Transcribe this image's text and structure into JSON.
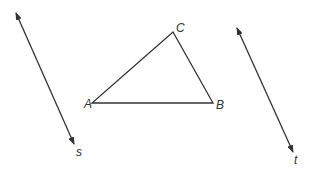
{
  "diagram": {
    "stroke_color": "#333333",
    "background": "#ffffff",
    "lines": [
      {
        "name": "s",
        "x1": 16,
        "y1": 13,
        "x2": 74,
        "y2": 144,
        "label": "s",
        "label_x": 76,
        "label_y": 156,
        "arrows": "both"
      },
      {
        "name": "t",
        "x1": 237,
        "y1": 28,
        "x2": 293,
        "y2": 152,
        "label": "t",
        "label_x": 294,
        "label_y": 164,
        "arrows": "both"
      }
    ],
    "triangle": {
      "vertices": [
        {
          "label": "A",
          "x": 92,
          "y": 103,
          "label_x": 84,
          "label_y": 108
        },
        {
          "label": "B",
          "x": 213,
          "y": 103,
          "label_x": 216,
          "label_y": 109
        },
        {
          "label": "C",
          "x": 173,
          "y": 32,
          "label_x": 176,
          "label_y": 32
        }
      ]
    }
  }
}
